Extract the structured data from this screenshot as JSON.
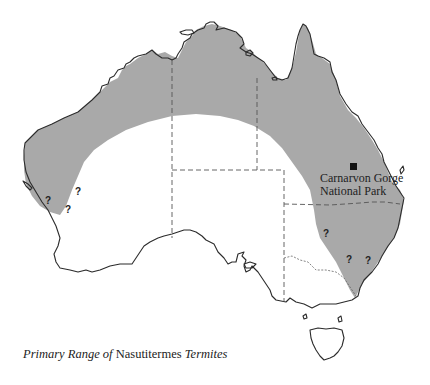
{
  "map": {
    "subject": "Australia",
    "range_fill_color": "#a9a9a9",
    "outline_color": "#2b2b2b",
    "background_color": "#ffffff"
  },
  "location": {
    "name_line1": "Carnarvon Gorge",
    "name_line2": "National Park",
    "marker": "filled-square"
  },
  "uncertain_markers": [
    {
      "label": "?",
      "x": 45,
      "y": 196
    },
    {
      "label": "?",
      "x": 75,
      "y": 188
    },
    {
      "label": "?",
      "x": 65,
      "y": 205
    },
    {
      "label": "?",
      "x": 324,
      "y": 230
    },
    {
      "label": "?",
      "x": 346,
      "y": 256
    },
    {
      "label": "?",
      "x": 365,
      "y": 257
    }
  ],
  "caption": {
    "part1": "Primary Range of",
    "part2": "Nasutitermes",
    "part3": "Termites"
  }
}
